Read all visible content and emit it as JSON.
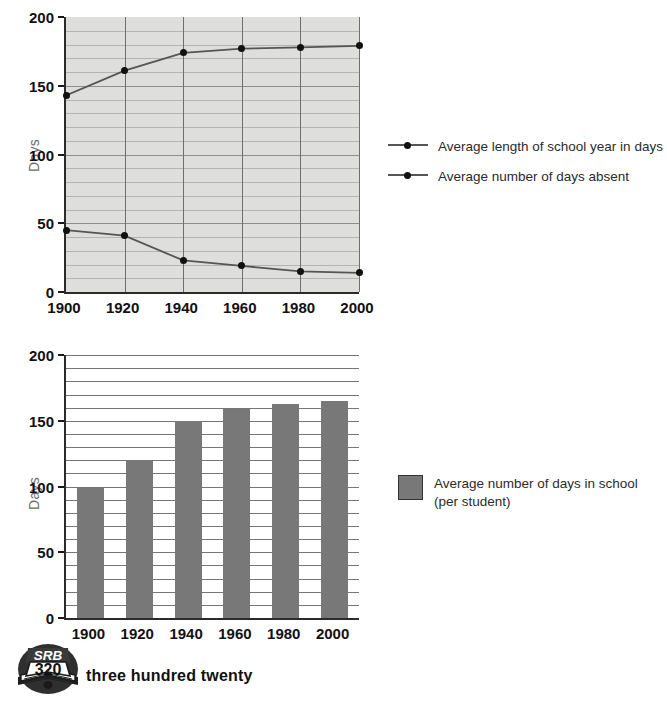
{
  "page": {
    "footer_text": "three hundred twenty",
    "logo": {
      "banner": "SRB",
      "page_number": "320"
    }
  },
  "charts": {
    "line_chart": {
      "ylabel": "Days",
      "legend": [
        {
          "label": "Average length of school year in days",
          "marker": "line-dot"
        },
        {
          "label": "Average number of days absent",
          "marker": "line-dot"
        }
      ]
    },
    "bar_chart": {
      "ylabel": "Days",
      "legend": [
        {
          "label": "Average number of days in school\n(per student)",
          "marker": "gray-swatch"
        }
      ]
    }
  },
  "chart_data": [
    {
      "type": "line",
      "title": "",
      "xlabel": "",
      "ylabel": "Days",
      "x": [
        1900,
        1920,
        1940,
        1960,
        1980,
        2000
      ],
      "xticklabels": [
        "1900",
        "1920",
        "1940",
        "1960",
        "1980",
        "2000"
      ],
      "yticklabels": [
        "0",
        "50",
        "100",
        "150",
        "200"
      ],
      "yticks": [
        0,
        50,
        100,
        150,
        200
      ],
      "ylim": [
        0,
        200
      ],
      "xlim": [
        1900,
        2000
      ],
      "grid": "horizontal-every-10-and-vertical-at-ticks",
      "legend_position": "right",
      "plot_background": "#dededd",
      "series": [
        {
          "name": "Average length of school year in days",
          "values": [
            143,
            161,
            174,
            177,
            178,
            179
          ],
          "color": "#555555",
          "marker_color": "#111111"
        },
        {
          "name": "Average number of days absent",
          "values": [
            45,
            41,
            23,
            19,
            15,
            14
          ],
          "color": "#555555",
          "marker_color": "#111111"
        }
      ]
    },
    {
      "type": "bar",
      "title": "",
      "xlabel": "",
      "ylabel": "Days",
      "categories": [
        "1900",
        "1920",
        "1940",
        "1960",
        "1980",
        "2000"
      ],
      "values": [
        99,
        120,
        150,
        159,
        163,
        165
      ],
      "yticklabels": [
        "0",
        "50",
        "100",
        "150",
        "200"
      ],
      "yticks": [
        0,
        50,
        100,
        150,
        200
      ],
      "ylim": [
        0,
        200
      ],
      "grid": "horizontal-every-10",
      "legend_position": "right",
      "bar_color": "#787878",
      "plot_background": "#ffffff",
      "series": [
        {
          "name": "Average number of days in school (per student)",
          "values": [
            99,
            120,
            150,
            159,
            163,
            165
          ]
        }
      ]
    }
  ]
}
